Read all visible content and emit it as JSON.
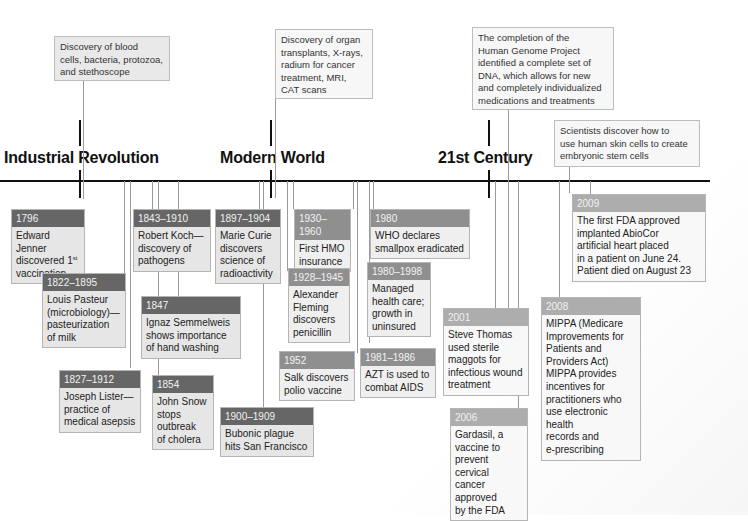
{
  "eras": [
    {
      "label": "Industrial Revolution"
    },
    {
      "label": "Modern World"
    },
    {
      "label": "21st Century"
    }
  ],
  "notes": [
    {
      "text_lines": [
        "Discovery of blood",
        "cells, bacteria, protozoa,",
        "and stethoscope"
      ]
    },
    {
      "text_lines": [
        "Discovery of organ",
        "transplants, X-rays,",
        "radium for cancer",
        "treatment, MRI,",
        "CAT scans"
      ]
    },
    {
      "text_lines": [
        "The completion of the",
        "Human Genome Project",
        "identified a complete set of",
        "DNA, which allows for new",
        "and completely individualized",
        "medications and treatments"
      ]
    },
    {
      "text_lines": [
        "Scientists discover how to",
        "use human skin cells to create",
        "embryonic stem cells"
      ]
    }
  ],
  "events": [
    {
      "date": "1796",
      "lines": [
        "Edward Jenner",
        "discovered 1",
        "vaccination"
      ],
      "sup": "st"
    },
    {
      "date": "1822–1895",
      "lines": [
        "Louis Pasteur",
        "(microbiology)—",
        "pasteurization",
        "of milk"
      ]
    },
    {
      "date": "1827–1912",
      "lines": [
        "Joseph Lister—",
        "practice of",
        "medical asepsis"
      ]
    },
    {
      "date": "1843–1910",
      "lines": [
        "Robert Koch—",
        "discovery of",
        "pathogens"
      ]
    },
    {
      "date": "1847",
      "lines": [
        "Ignaz Semmelweis",
        "shows importance",
        "of hand washing"
      ]
    },
    {
      "date": "1854",
      "lines": [
        "John Snow",
        "stops",
        "outbreak",
        "of cholera"
      ]
    },
    {
      "date": "1897–1904",
      "lines": [
        "Marie Curie",
        "discovers",
        "science of",
        "radioactivity"
      ]
    },
    {
      "date": "1900–1909",
      "lines": [
        "Bubonic plague",
        "hits San Francisco"
      ]
    },
    {
      "date": "1930–1960",
      "lines": [
        "First HMO",
        "insurance"
      ]
    },
    {
      "date": "1928–1945",
      "lines": [
        "Alexander",
        "Fleming",
        "discovers",
        "penicillin"
      ]
    },
    {
      "date": "1952",
      "lines": [
        "Salk discovers",
        "polio vaccine"
      ]
    },
    {
      "date": "1980",
      "lines": [
        "WHO declares",
        "smallpox eradicated"
      ]
    },
    {
      "date": "1980–1998",
      "lines": [
        "Managed",
        "health care;",
        "growth in",
        "uninsured"
      ]
    },
    {
      "date": "1981–1986",
      "lines": [
        "AZT is used to",
        "combat AIDS"
      ]
    },
    {
      "date": "2001",
      "lines": [
        "Steve Thomas",
        "used sterile",
        "maggots for",
        "infectious wound",
        "treatment"
      ]
    },
    {
      "date": "2006",
      "lines": [
        "Gardasil, a",
        "vaccine to",
        "prevent cervical",
        "cancer approved",
        "by the FDA"
      ]
    },
    {
      "date": "2008",
      "lines": [
        "MIPPA (Medicare",
        "Improvements for",
        "Patients and",
        "Providers Act)",
        "MIPPA provides",
        "incentives for",
        "practitioners who",
        "use electronic health",
        "records and",
        "e-prescribing"
      ]
    },
    {
      "date": "2009",
      "lines": [
        "The first FDA approved",
        "implanted AbioCor",
        "artificial heart placed",
        "in a patient on June 24.",
        "Patient died on August 23"
      ]
    }
  ]
}
